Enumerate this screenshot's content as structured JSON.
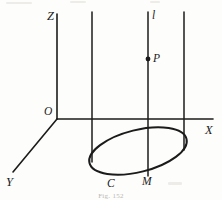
{
  "figure": {
    "kind": "3d-coordinate-geometry-diagram",
    "caption": "Fig. 152",
    "stroke_color": "#1b1b1b",
    "background_color": "#fdfdfb",
    "labels": {
      "z_axis": "Z",
      "x_axis": "X",
      "y_axis": "Y",
      "origin": "O",
      "line_l": "l",
      "point_p": "P",
      "point_m": "M",
      "curve_c": "C"
    },
    "geometry": {
      "origin": {
        "x": 57,
        "y": 119
      },
      "z_axis": {
        "x1": 57,
        "y1": 14,
        "x2": 57,
        "y2": 119
      },
      "x_axis": {
        "x1": 57,
        "y1": 119,
        "x2": 213,
        "y2": 119
      },
      "y_axis": {
        "x1": 57,
        "y1": 119,
        "x2": 13,
        "y2": 172
      },
      "vertical_lines": [
        {
          "name": "left-generatrix",
          "x": 92,
          "y_top": 12,
          "y_bottom": 162
        },
        {
          "name": "line-l",
          "x": 148,
          "y_top": 12,
          "y_bottom": 176
        },
        {
          "name": "right-generatrix",
          "x": 184,
          "y_top": 12,
          "y_bottom": 150
        }
      ],
      "ellipse": {
        "center_x": 138,
        "center_y": 151,
        "radius_x": 50,
        "radius_y": 21,
        "rotation_deg": -14
      },
      "point_p": {
        "x": 148,
        "y": 59,
        "dot_radius": 2.4
      },
      "point_m": {
        "x": 148,
        "y": 176
      }
    },
    "label_positions": {
      "z_axis": {
        "x": 47,
        "y": 10
      },
      "x_axis": {
        "x": 205,
        "y": 124
      },
      "y_axis": {
        "x": 6,
        "y": 176
      },
      "origin": {
        "x": 44,
        "y": 106
      },
      "line_l": {
        "x": 152,
        "y": 10
      },
      "point_p": {
        "x": 153,
        "y": 53
      },
      "point_m": {
        "x": 142,
        "y": 176
      },
      "curve_c": {
        "x": 107,
        "y": 178
      }
    }
  }
}
